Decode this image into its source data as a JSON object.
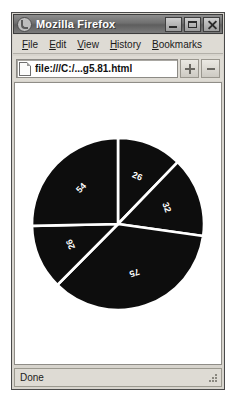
{
  "window": {
    "title": "Mozilla Firefox",
    "icon": "firefox-icon",
    "controls": {
      "minimize": "Minimize",
      "maximize": "Maximize",
      "close": "Close"
    }
  },
  "menubar": {
    "items": [
      {
        "label": "File",
        "accel": "F",
        "rest": "ile"
      },
      {
        "label": "Edit",
        "accel": "E",
        "rest": "dit"
      },
      {
        "label": "View",
        "accel": "V",
        "rest": "iew"
      },
      {
        "label": "History",
        "accel": "H",
        "rest": "istory"
      },
      {
        "label": "Bookmarks",
        "accel": "B",
        "rest": "ookmarks"
      }
    ]
  },
  "navbar": {
    "url": "file:///C:/...g5.81.html",
    "placeholder": "Enter address",
    "page_icon": "page-icon",
    "button_add": "+",
    "button_more": "-"
  },
  "statusbar": {
    "text": "Done"
  },
  "chart_data": {
    "type": "pie",
    "title": "",
    "labels": [
      "26",
      "32",
      "75",
      "26",
      "54"
    ],
    "values": [
      26,
      32,
      75,
      26,
      54
    ],
    "total": 213,
    "start_angle_deg": -90,
    "direction": "clockwise",
    "slice_color": "#0d0d0d",
    "separator_color": "#ffffff",
    "label_color": "#ffffff",
    "label_rotated": true,
    "legend": "none",
    "grid": false
  }
}
